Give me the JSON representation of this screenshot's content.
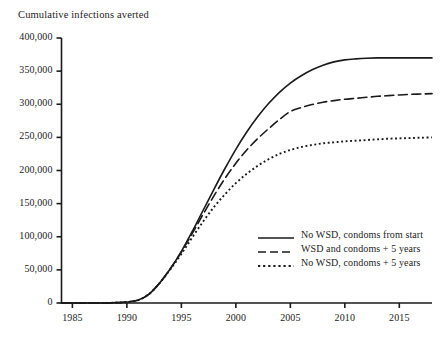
{
  "chart_data": {
    "type": "line",
    "title": "Cumulative infections averted",
    "xlabel": "",
    "ylabel": "Cumulative infections averted",
    "xlim": [
      1984,
      2018
    ],
    "ylim": [
      0,
      400000
    ],
    "grid": false,
    "legend_position": "inside-right",
    "x_ticks": [
      "1985",
      "1990",
      "1995",
      "2000",
      "2005",
      "2010",
      "2015"
    ],
    "y_ticks": [
      "0",
      "50,000",
      "100,000",
      "150,000",
      "200,000",
      "250,000",
      "300,000",
      "350,000",
      "400,000"
    ],
    "x": [
      1984,
      1985,
      1986,
      1987,
      1988,
      1989,
      1990,
      1991,
      1992,
      1993,
      1994,
      1995,
      1996,
      1997,
      1998,
      1999,
      2000,
      2001,
      2002,
      2003,
      2004,
      2005,
      2006,
      2007,
      2008,
      2009,
      2010,
      2011,
      2012,
      2013,
      2014,
      2015,
      2016,
      2017,
      2018
    ],
    "series": [
      {
        "name": "No WSD, condoms from start",
        "style": "solid",
        "values": [
          0,
          0,
          0,
          0,
          0,
          500,
          1500,
          4000,
          13000,
          30000,
          52000,
          78000,
          108000,
          140000,
          172000,
          203000,
          232000,
          258000,
          281000,
          301000,
          318000,
          332000,
          343000,
          352000,
          359000,
          364000,
          367000,
          368500,
          369500,
          370000,
          370000,
          370000,
          370000,
          370000,
          370000
        ]
      },
      {
        "name": "WSD and condoms + 5 years",
        "style": "dashed",
        "values": [
          0,
          0,
          0,
          0,
          0,
          500,
          1500,
          4000,
          13000,
          30000,
          52000,
          77000,
          105000,
          134000,
          162000,
          188000,
          211000,
          231000,
          248000,
          263000,
          277000,
          289000,
          295000,
          299500,
          303000,
          305500,
          307500,
          309000,
          310500,
          312000,
          313000,
          314000,
          315000,
          315500,
          316000
        ]
      },
      {
        "name": "No WSD, condoms + 5 years",
        "style": "dotted",
        "values": [
          0,
          0,
          0,
          0,
          0,
          500,
          1500,
          4000,
          13000,
          30000,
          51000,
          74000,
          99000,
          123000,
          145000,
          164000,
          181000,
          195000,
          207000,
          217000,
          225000,
          231000,
          235500,
          238500,
          241000,
          242500,
          244000,
          245000,
          246000,
          247000,
          248000,
          248500,
          249000,
          249500,
          250000
        ]
      }
    ]
  },
  "legend": {
    "entries": [
      {
        "label": "No WSD, condoms from start",
        "style": "solid"
      },
      {
        "label": "WSD and condoms + 5 years",
        "style": "dashed"
      },
      {
        "label": "No WSD, condoms + 5 years",
        "style": "dotted"
      }
    ]
  },
  "colors": {
    "line": "#1a1a1a",
    "axis": "#1a1a1a",
    "background": "#ffffff",
    "text": "#1d1d1d"
  }
}
